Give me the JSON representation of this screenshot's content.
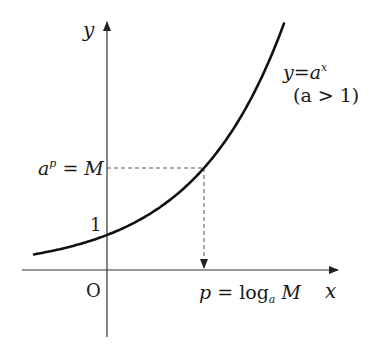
{
  "diagram": {
    "type": "exponential-function-graph",
    "axes": {
      "x_label": "x",
      "y_label": "y",
      "origin_label": "O",
      "y_intercept_label": "1"
    },
    "curve": {
      "equation_lhs": "y",
      "equation_eq": "=",
      "equation_base": "a",
      "equation_exp": "x",
      "condition": "(a > 1)"
    },
    "point": {
      "y_label_base": "a",
      "y_label_exp": "p",
      "y_label_rest": " = M",
      "x_label_p": "p",
      "x_label_eq": " = log",
      "x_label_sub": "a",
      "x_label_M": " M"
    },
    "colors": {
      "axis": "#333333",
      "curve": "#111111",
      "dashed": "#555555"
    }
  }
}
